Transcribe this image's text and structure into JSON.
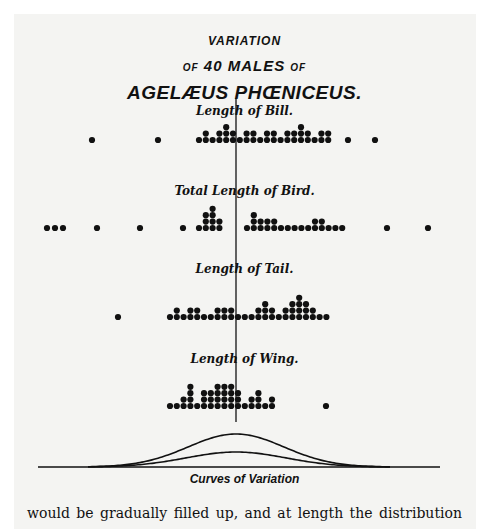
{
  "figure": {
    "title_line1": "VARIATION",
    "title_line2_pre": "OF",
    "title_line2_main": "40 MALES",
    "title_line2_post": "OF",
    "title_line3": "AGELÆUS PHŒNICEUS.",
    "curves_label": "Curves of Variation",
    "body_text": "would be gradually filled up, and at length the distribution"
  },
  "chart_data": [
    {
      "type": "scatter",
      "title": "Length of Bill.",
      "description": "Dot-stack histogram, one dot per specimen (40 males)",
      "outliers_x": [
        92,
        158,
        348,
        375
      ],
      "cluster_start_x": 199,
      "column_heights": [
        1,
        2,
        1,
        2,
        3,
        2,
        1,
        2,
        2,
        1,
        2,
        2,
        1,
        2,
        2,
        3,
        2,
        1,
        2,
        2
      ],
      "baseline_y": 140,
      "n": 40
    },
    {
      "type": "scatter",
      "title": "Total Length of Bird.",
      "outliers_x": [
        47,
        55,
        63,
        97,
        140,
        183,
        387,
        428
      ],
      "clusters": [
        {
          "start_x": 199,
          "column_heights": [
            1,
            3,
            4,
            2
          ]
        },
        {
          "start_x": 247,
          "column_heights": [
            1,
            3,
            2,
            2,
            2,
            1,
            1,
            1,
            1,
            1,
            2,
            2,
            1,
            1,
            1
          ]
        }
      ],
      "baseline_y": 228,
      "n": 40
    },
    {
      "type": "scatter",
      "title": "Length of Tail.",
      "outliers_x": [
        118
      ],
      "cluster_start_x": 170,
      "column_heights": [
        1,
        2,
        1,
        2,
        2,
        1,
        1,
        2,
        2,
        2,
        1,
        1,
        1,
        2,
        3,
        2,
        1,
        2,
        3,
        4,
        3,
        2,
        1,
        1
      ],
      "baseline_y": 317,
      "n": 40
    },
    {
      "type": "scatter",
      "title": "Length of Wing.",
      "outliers_x": [
        326
      ],
      "cluster_start_x": 170,
      "column_heights": [
        1,
        1,
        2,
        4,
        1,
        3,
        3,
        4,
        4,
        4,
        3,
        1,
        2,
        3,
        1,
        2
      ],
      "baseline_y": 406,
      "n": 40
    }
  ],
  "curves": {
    "baseline_y": 467,
    "x_range": [
      38,
      440
    ],
    "mean_x": 236,
    "outer_peak_y": 434,
    "inner_peak_y": 452
  },
  "colors": {
    "ink": "#111111",
    "paper": "#f4f4f2"
  }
}
